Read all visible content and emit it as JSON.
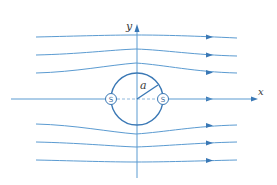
{
  "colors": {
    "streamline": "#5b9bd1",
    "circle": "#3a78b5",
    "axis": "#5b9bd1",
    "dashed": "#8fb8dc",
    "text": "#3a3a3a"
  },
  "labels": {
    "x_axis": "x",
    "y_axis": "y",
    "radius": "a",
    "stagnation_left": "S",
    "stagnation_right": "S"
  },
  "geometry": {
    "origin": [
      137,
      99
    ],
    "radius_px": 26
  },
  "streamlines": [
    {
      "id": "upper-1",
      "y_far": 37,
      "y_center": 35
    },
    {
      "id": "upper-2",
      "y_far": 55,
      "y_center": 49
    },
    {
      "id": "upper-3",
      "y_far": 73,
      "y_center": 63
    },
    {
      "id": "lower-1",
      "y_far": 125,
      "y_center": 134
    },
    {
      "id": "lower-2",
      "y_far": 143,
      "y_center": 147
    },
    {
      "id": "lower-3",
      "y_far": 161,
      "y_center": 162
    }
  ]
}
